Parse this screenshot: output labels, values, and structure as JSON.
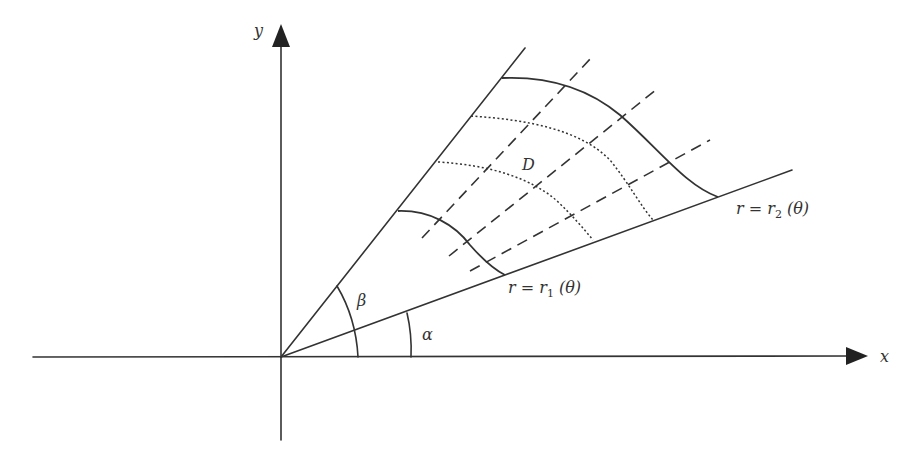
{
  "figure": {
    "axes": {
      "x_label": "x",
      "y_label": "y"
    },
    "angles": {
      "alpha_label": "α",
      "beta_label": "β"
    },
    "region_label": "D",
    "curves": {
      "inner": {
        "prefix": "r = r",
        "subscript": "1",
        "suffix": " (θ)"
      },
      "outer": {
        "prefix": "r = r",
        "subscript": "2",
        "suffix": " (θ)"
      }
    },
    "colors": {
      "stroke": "#333333",
      "background": "#ffffff"
    }
  }
}
